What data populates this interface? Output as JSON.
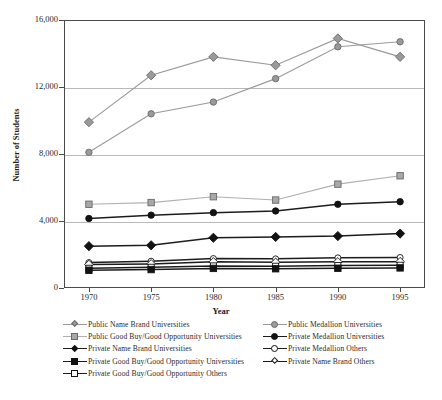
{
  "chart_data": {
    "type": "line",
    "title": "",
    "xlabel": "Year",
    "ylabel": "Number of Students",
    "x": [
      1970,
      1975,
      1980,
      1985,
      1990,
      1995
    ],
    "xtick_labels": [
      "1970",
      "1975",
      "1980",
      "1985",
      "1990",
      "1995"
    ],
    "ytick_labels": [
      "0",
      "4,000",
      "8,000",
      "12,000",
      "16,000"
    ],
    "ytick_values": [
      0,
      4000,
      8000,
      12000,
      16000
    ],
    "ylim": [
      0,
      16000
    ],
    "xlim": [
      1968,
      1997
    ],
    "grid": "horizontal",
    "legend_position": "below-plot",
    "series": [
      {
        "name": "Public Name Brand Universities",
        "marker": "diamond",
        "marker_fill": "#9a9a9a",
        "marker_edge": "#6a6a6a",
        "line_color": "#9a9a9a",
        "values": [
          9900,
          12700,
          13800,
          13300,
          14900,
          13800
        ]
      },
      {
        "name": "Public Medallion Universities",
        "marker": "circle",
        "marker_fill": "#9a9a9a",
        "marker_edge": "#6a6a6a",
        "line_color": "#9a9a9a",
        "values": [
          8100,
          10400,
          11100,
          12500,
          14400,
          14700
        ]
      },
      {
        "name": "Public Good Buy/Good Opportunity Universities",
        "marker": "square",
        "marker_fill": "#a8a8a8",
        "marker_edge": "#6a6a6a",
        "line_color": "#b0b0b0",
        "values": [
          5000,
          5100,
          5450,
          5250,
          6200,
          6700
        ]
      },
      {
        "name": "Private Medallion Universities",
        "marker": "circle",
        "marker_fill": "#121212",
        "marker_edge": "#121212",
        "line_color": "#1c1c1c",
        "values": [
          4150,
          4350,
          4500,
          4600,
          5000,
          5150
        ]
      },
      {
        "name": "Private Name Brand Universities",
        "marker": "diamond",
        "marker_fill": "#121212",
        "marker_edge": "#121212",
        "line_color": "#1c1c1c",
        "values": [
          2500,
          2550,
          3000,
          3050,
          3100,
          3250
        ]
      },
      {
        "name": "Private Medallion Others",
        "marker": "circle",
        "marker_fill": "#ffffff",
        "marker_edge": "#121212",
        "line_color": "#1c1c1c",
        "values": [
          1520,
          1600,
          1760,
          1740,
          1800,
          1820
        ]
      },
      {
        "name": "Private Name Brand Others",
        "marker": "diamond",
        "marker_fill": "#ffffff",
        "marker_edge": "#121212",
        "line_color": "#1c1c1c",
        "values": [
          1400,
          1440,
          1560,
          1530,
          1560,
          1570
        ]
      },
      {
        "name": "Private Good Buy/Good Opportunity Others",
        "marker": "square",
        "marker_fill": "#ffffff",
        "marker_edge": "#121212",
        "line_color": "#1c1c1c",
        "values": [
          1180,
          1240,
          1320,
          1300,
          1340,
          1360
        ]
      },
      {
        "name": "Private Good Buy/Good Opportunity Universities",
        "marker": "square",
        "marker_fill": "#121212",
        "marker_edge": "#121212",
        "line_color": "#1c1c1c",
        "values": [
          1060,
          1100,
          1170,
          1150,
          1180,
          1200
        ]
      }
    ]
  },
  "legend": {
    "left_column": [
      {
        "label": "Public Name Brand Universities",
        "marker": "diamond",
        "fill": "#9a9a9a",
        "edge": "#6a6a6a",
        "line": "#9a9a9a"
      },
      {
        "label": "Public Good Buy/Good Opportunity Universities",
        "marker": "square",
        "fill": "#a8a8a8",
        "edge": "#6a6a6a",
        "line": "#b0b0b0"
      },
      {
        "label": "Private Name Brand Universities",
        "marker": "diamond",
        "fill": "#121212",
        "edge": "#121212",
        "line": "#1c1c1c"
      },
      {
        "label": "Private Good Buy/Good Opportunity Universities",
        "marker": "square",
        "fill": "#121212",
        "edge": "#121212",
        "line": "#1c1c1c"
      },
      {
        "label": "Private Good Buy/Good Opportunity Others",
        "marker": "square",
        "fill": "#ffffff",
        "edge": "#121212",
        "line": "#1c1c1c"
      }
    ],
    "right_column": [
      {
        "label": "Public Medallion Universities",
        "marker": "circle",
        "fill": "#9a9a9a",
        "edge": "#6a6a6a",
        "line": "#9a9a9a"
      },
      {
        "label": "Private Medallion Universities",
        "marker": "circle",
        "fill": "#121212",
        "edge": "#121212",
        "line": "#1c1c1c"
      },
      {
        "label": "Private Medallion Others",
        "marker": "circle",
        "fill": "#ffffff",
        "edge": "#121212",
        "line": "#1c1c1c"
      },
      {
        "label": "Private Name Brand Others",
        "marker": "diamond",
        "fill": "#ffffff",
        "edge": "#121212",
        "line": "#1c1c1c"
      }
    ]
  }
}
